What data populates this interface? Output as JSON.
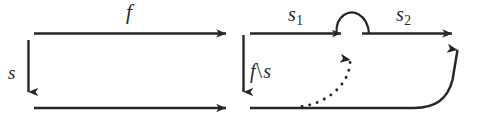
{
  "diagram": {
    "background_color": "#ffffff",
    "stroke_color": "#262626",
    "labels": {
      "f": "f",
      "s": "s",
      "s1_base": "s",
      "s1_sub": "1",
      "s2_base": "s",
      "s2_sub": "2",
      "f_backslash_s_left": "f",
      "f_backslash_s_op": "\\",
      "f_backslash_s_right": "s"
    },
    "edges": [
      {
        "name": "top-left-arrow",
        "label": "f",
        "style": "solid",
        "direction": "right"
      },
      {
        "name": "bottom-left-arrow",
        "label": "",
        "style": "solid",
        "direction": "right"
      },
      {
        "name": "left-vertical-arrow",
        "label": "s",
        "style": "solid",
        "direction": "down"
      },
      {
        "name": "middle-vertical-arrow",
        "label": "f\\s",
        "style": "solid",
        "direction": "down"
      },
      {
        "name": "s1-arrow",
        "label": "s1",
        "style": "solid",
        "direction": "right"
      },
      {
        "name": "s2-arrow",
        "label": "s2",
        "style": "solid",
        "direction": "right"
      },
      {
        "name": "loop-arc",
        "label": "",
        "style": "solid",
        "direction": "over"
      },
      {
        "name": "dashed-curve-arrow",
        "label": "",
        "style": "dashed",
        "direction": "up"
      },
      {
        "name": "right-curve-arrow",
        "label": "",
        "style": "solid",
        "direction": "up"
      }
    ]
  }
}
